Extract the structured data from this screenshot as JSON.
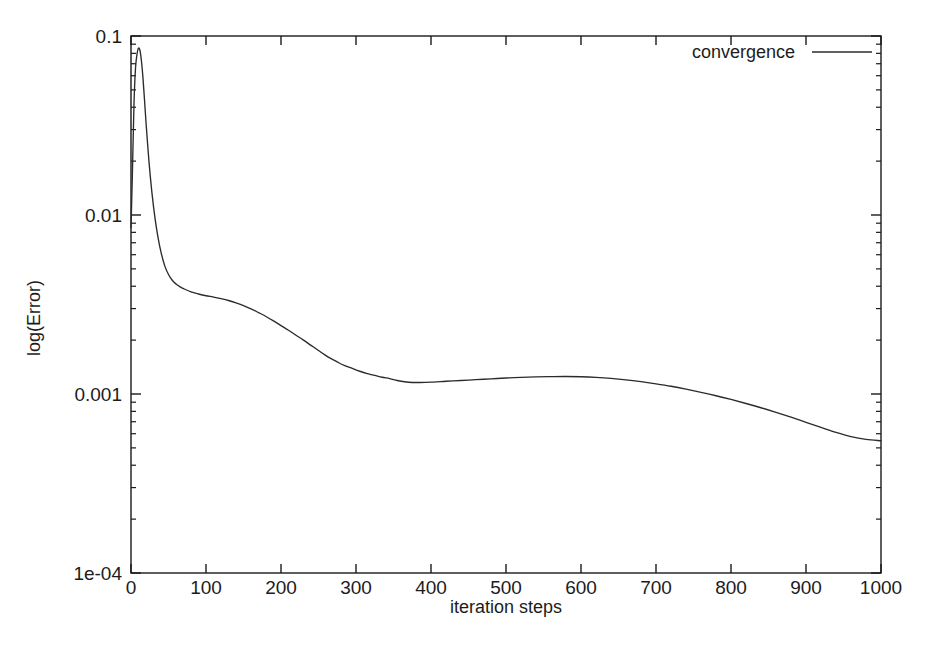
{
  "chart_data": {
    "type": "line",
    "title": "",
    "xlabel": "iteration steps",
    "ylabel": "log(Error)",
    "xlim": [
      0,
      1000
    ],
    "ylim": [
      0.0001,
      0.1
    ],
    "yscale": "log",
    "xscale": "linear",
    "grid": false,
    "legend_position": "top-right",
    "xticklabels": [
      "0",
      "100",
      "200",
      "300",
      "400",
      "500",
      "600",
      "700",
      "800",
      "900",
      "1000"
    ],
    "xticks": [
      0,
      100,
      200,
      300,
      400,
      500,
      600,
      700,
      800,
      900,
      1000
    ],
    "yticklabels": [
      "0.1",
      "0.01",
      "0.001",
      "1e-04"
    ],
    "yticks": [
      0.1,
      0.01,
      0.001,
      0.0001
    ],
    "series": [
      {
        "name": "convergence",
        "color": "#2b2b2b",
        "x": [
          0,
          2,
          4,
          6,
          8,
          10,
          12,
          14,
          16,
          18,
          20,
          24,
          28,
          32,
          36,
          40,
          45,
          50,
          55,
          60,
          65,
          70,
          80,
          90,
          100,
          110,
          120,
          130,
          140,
          150,
          160,
          170,
          180,
          190,
          200,
          210,
          220,
          230,
          240,
          250,
          258,
          265,
          275,
          285,
          295,
          305,
          315,
          325,
          335,
          345,
          355,
          365,
          375,
          385,
          400,
          420,
          440,
          460,
          480,
          500,
          520,
          540,
          560,
          580,
          600,
          620,
          640,
          660,
          680,
          700,
          720,
          740,
          760,
          780,
          800,
          820,
          840,
          860,
          880,
          900,
          920,
          940,
          960,
          980,
          1000
        ],
        "y": [
          0.0085,
          0.018,
          0.042,
          0.066,
          0.079,
          0.0855,
          0.083,
          0.072,
          0.058,
          0.044,
          0.033,
          0.0198,
          0.0132,
          0.0096,
          0.0075,
          0.0062,
          0.0052,
          0.00465,
          0.00432,
          0.00412,
          0.00398,
          0.00388,
          0.00372,
          0.00362,
          0.00354,
          0.00348,
          0.00341,
          0.00333,
          0.00323,
          0.00312,
          0.00299,
          0.00285,
          0.00271,
          0.00256,
          0.00241,
          0.00227,
          0.00213,
          0.002,
          0.00187,
          0.00175,
          0.00166,
          0.00159,
          0.00151,
          0.00144,
          0.00139,
          0.00134,
          0.0013,
          0.00127,
          0.00124,
          0.00122,
          0.00119,
          0.00117,
          0.00116,
          0.00116,
          0.001165,
          0.001178,
          0.00119,
          0.001203,
          0.001215,
          0.001228,
          0.001238,
          0.001246,
          0.00125,
          0.001252,
          0.001248,
          0.001238,
          0.001222,
          0.0012,
          0.001172,
          0.00114,
          0.001105,
          0.001065,
          0.001022,
          0.000978,
          0.000932,
          0.000885,
          0.000838,
          0.00079,
          0.000742,
          0.000695,
          0.000651,
          0.00061,
          0.000578,
          0.000558,
          0.000548
        ]
      }
    ]
  },
  "legend": {
    "entries": [
      {
        "label": "convergence"
      }
    ]
  },
  "axes": {
    "x_title": "iteration steps",
    "y_title": "log(Error)"
  }
}
